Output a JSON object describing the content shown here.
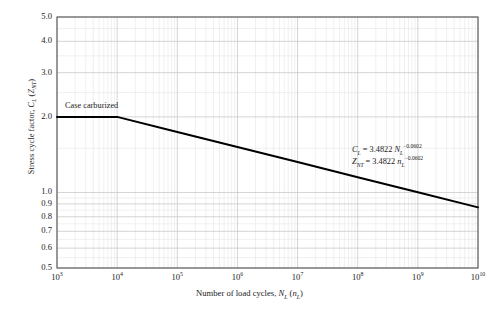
{
  "chart_data": {
    "type": "line",
    "title": "",
    "xlabel": "Number of load cycles, N_L (n_L)",
    "ylabel": "Stress cycle factor, C_L (Z_NT)",
    "xscale": "log",
    "yscale": "log",
    "xlim": [
      1000,
      10000000000
    ],
    "ylim": [
      0.5,
      5.0
    ],
    "grid": true,
    "grid_minor": true,
    "legend": "none",
    "xticks": [
      1000,
      10000,
      100000,
      1000000,
      10000000,
      100000000,
      1000000000,
      10000000000
    ],
    "xtick_labels": [
      "10^3",
      "10^4",
      "10^5",
      "10^6",
      "10^7",
      "10^8",
      "10^9",
      "10^10"
    ],
    "yticks": [
      0.5,
      0.6,
      0.7,
      0.8,
      0.9,
      1.0,
      2.0,
      3.0,
      4.0,
      5.0
    ],
    "ytick_labels": [
      "0.5",
      "0.6",
      "0.7",
      "0.8",
      "0.9",
      "1.0",
      "2.0",
      "3.0",
      "4.0",
      "5.0"
    ],
    "series": [
      {
        "name": "Case carburized",
        "color": "#000000",
        "linewidth": 2,
        "x": [
          1000,
          10000,
          100000,
          1000000,
          10000000,
          100000000,
          1000000000,
          10000000000
        ],
        "y": [
          2.0,
          2.0,
          1.742,
          1.517,
          1.321,
          1.15,
          1.001,
          0.872
        ]
      }
    ],
    "annotations": [
      {
        "name": "curve-label",
        "text": "Case carburized"
      },
      {
        "name": "equation-cl",
        "text": "C_L = 3.4822 N_L^-0.0602"
      },
      {
        "name": "equation-znt",
        "text": "Z_NT = 3.4822 n_L^-0.0602"
      }
    ]
  },
  "axes": {
    "y_title": {
      "pre": "Stress cycle factor, ",
      "sym1": "C",
      "sub1": "L",
      "mid": " (",
      "sym2": "Z",
      "sub2": "NT",
      "post": ")"
    },
    "x_title": {
      "pre": "Number of load cycles, ",
      "sym1": "N",
      "sub1": "L",
      "mid": " (",
      "sym2": "n",
      "sub2": "L",
      "post": ")"
    },
    "y_tick_labels": [
      "5.0",
      "4.0",
      "3.0",
      "2.0",
      "1.0",
      "0.9",
      "0.8",
      "0.7",
      "0.6",
      "0.5"
    ],
    "x_tick_bases": [
      "10",
      "10",
      "10",
      "10",
      "10",
      "10",
      "10",
      "10"
    ],
    "x_tick_exponents": [
      "3",
      "4",
      "5",
      "6",
      "7",
      "8",
      "9",
      "10"
    ]
  },
  "annotations": {
    "curve_label": "Case carburized",
    "eq1": {
      "sym": "C",
      "sub": "L",
      "eq": " = 3.4822 ",
      "var": "N",
      "varsub": "L",
      "exp": "−0.0602"
    },
    "eq2": {
      "sym": "Z",
      "sub": "NT",
      "eq": " = 3.4822 ",
      "var": "n",
      "varsub": "L",
      "exp": "−0.0602"
    }
  },
  "colors": {
    "curve": "#000000",
    "axis": "#555555",
    "grid_major": "#c9c9c9",
    "grid_minor": "#e6e6e6",
    "background": "#ffffff"
  }
}
